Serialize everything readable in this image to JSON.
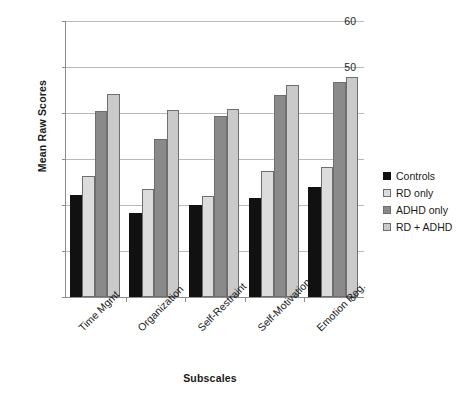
{
  "chart_data": {
    "type": "bar",
    "title": "",
    "xlabel": "Subscales",
    "ylabel": "Mean Raw Scores",
    "categories": [
      "Time Mgmt",
      "Organization",
      "Self-Restraint",
      "Self-Motivation",
      "Emotion Reg."
    ],
    "series": [
      {
        "name": "Controls",
        "color": "#111111",
        "values": [
          22.2,
          18.3,
          19.9,
          21.5,
          23.9
        ]
      },
      {
        "name": "RD only",
        "color": "#dcdcdc",
        "values": [
          26.3,
          23.4,
          22.0,
          27.3,
          28.3
        ]
      },
      {
        "name": "ADHD only",
        "color": "#8a8a8a",
        "values": [
          40.4,
          34.3,
          39.4,
          44.0,
          46.7
        ]
      },
      {
        "name": "RD + ADHD",
        "color": "#cacaca",
        "values": [
          44.1,
          40.7,
          40.8,
          46.0,
          47.9
        ]
      }
    ],
    "ylim": [
      0,
      60
    ],
    "yticks": [
      0,
      10,
      20,
      30,
      40,
      50,
      60
    ],
    "ytick_labels": [
      "0",
      "10",
      "20",
      "30",
      "40",
      "50",
      "60"
    ],
    "grid": "horizontal",
    "legend_position": "right",
    "legend_entries": [
      "Controls",
      "RD only",
      "ADHD only",
      "RD + ADHD"
    ],
    "xtick_rotation": -45
  }
}
